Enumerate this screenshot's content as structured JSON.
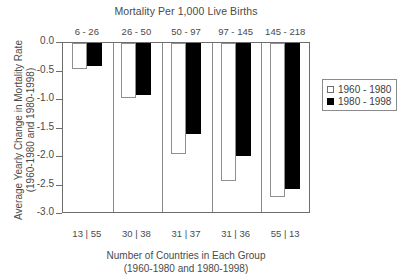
{
  "chart_data": {
    "type": "bar",
    "title": "Mortality Per 1,000 Live Births",
    "xlabel_line1": "Number of Countries in Each Group",
    "xlabel_line2": "(1960-1980 and 1980-1998)",
    "ylabel_line1": "Average Yearly Change in Mortality Rate",
    "ylabel_line2": "(1960-1980 and 1980-1998)",
    "categories": [
      "6 - 26",
      "26 - 50",
      "50 - 97",
      "97 - 145",
      "145 - 218"
    ],
    "group_counts": [
      "13 | 55",
      "30 | 38",
      "31 | 37",
      "31 | 36",
      "55 | 13"
    ],
    "series": [
      {
        "name": "1960 - 1980",
        "color": "#ffffff",
        "values": [
          -0.46,
          -0.96,
          -1.95,
          -2.42,
          -2.7
        ]
      },
      {
        "name": "1980 - 1998",
        "color": "#000000",
        "values": [
          -0.4,
          -0.91,
          -1.6,
          -1.98,
          -2.56
        ]
      }
    ],
    "ylim": [
      -3.0,
      0.0
    ],
    "yticks": [
      0.0,
      -0.5,
      -1.0,
      -1.5,
      -2.0,
      -2.5,
      -3.0
    ],
    "ytick_labels": [
      "0.0",
      "-0.5",
      "-1.0",
      "-1.5",
      "-2.0",
      "-2.5",
      "-3.0"
    ],
    "grid": false,
    "legend_position": "right"
  },
  "legend": {
    "items": [
      {
        "label": "1960 - 1980"
      },
      {
        "label": "1980 - 1998"
      }
    ]
  }
}
